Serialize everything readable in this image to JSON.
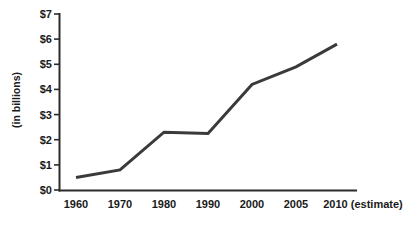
{
  "chart_data": {
    "type": "line",
    "title": "",
    "subtitle": "",
    "xlabel": "",
    "ylabel": "(in billions)",
    "grid": false,
    "legend": false,
    "legend_position": "none",
    "line_color": "#3a3a3a",
    "axis_color": "#2b2b2b",
    "background_color": "#ffffff",
    "categories": [
      "1960",
      "1970",
      "1980",
      "1990",
      "2000",
      "2005",
      "2010 (estimate)"
    ],
    "x_tick_labels": [
      "1960",
      "1970",
      "1980",
      "1990",
      "2000",
      "2005",
      "2010 (estimate)"
    ],
    "y_tick_labels": [
      "$0",
      "$1",
      "$2",
      "$3",
      "$4",
      "$5",
      "$6",
      "$7"
    ],
    "y_tick_values": [
      0,
      1,
      2,
      3,
      4,
      5,
      6,
      7
    ],
    "ylim": [
      0,
      7
    ],
    "y_unit": "$ billions",
    "values": [
      0.5,
      0.8,
      2.3,
      2.25,
      4.2,
      4.9,
      5.8
    ],
    "series": [
      {
        "name": "",
        "values": [
          0.5,
          0.8,
          2.3,
          2.25,
          4.2,
          4.9,
          5.8
        ]
      }
    ],
    "points": [
      {
        "x": "1960",
        "y": 0.5
      },
      {
        "x": "1970",
        "y": 0.8
      },
      {
        "x": "1980",
        "y": 2.3
      },
      {
        "x": "1990",
        "y": 2.25
      },
      {
        "x": "2000",
        "y": 4.2
      },
      {
        "x": "2005",
        "y": 4.9
      },
      {
        "x": "2010 (estimate)",
        "y": 5.8
      }
    ]
  }
}
